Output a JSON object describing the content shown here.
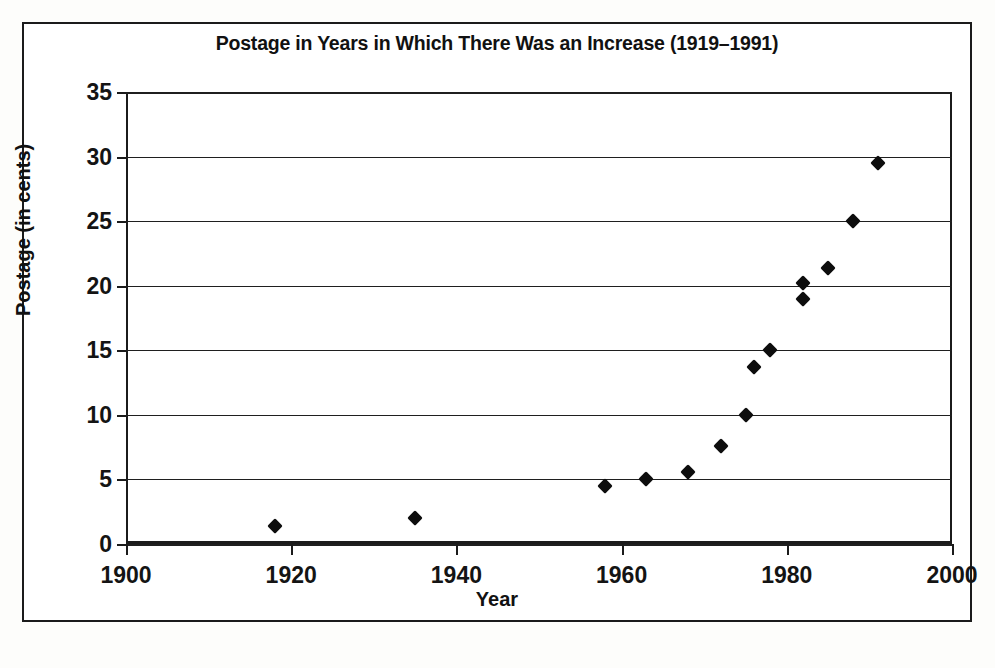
{
  "chart_data": {
    "type": "scatter",
    "title": "Postage in Years in Which There Was an Increase (1919–1991)",
    "xlabel": "Year",
    "ylabel": "Postage (in cents)",
    "xlim": [
      1900,
      2000
    ],
    "ylim": [
      0,
      35
    ],
    "xticks": [
      1900,
      1920,
      1940,
      1960,
      1980,
      2000
    ],
    "yticks": [
      0,
      5,
      10,
      15,
      20,
      25,
      30,
      35
    ],
    "grid": "horizontal",
    "legend": "none",
    "marker": "filled-diamond",
    "marker_color": "#0d0d0d",
    "points": [
      {
        "x": 1918,
        "y": 1.4
      },
      {
        "x": 1935,
        "y": 2.0
      },
      {
        "x": 1958,
        "y": 4.5
      },
      {
        "x": 1963,
        "y": 5.0
      },
      {
        "x": 1968,
        "y": 5.6
      },
      {
        "x": 1972,
        "y": 7.6
      },
      {
        "x": 1975,
        "y": 10.0
      },
      {
        "x": 1976,
        "y": 13.7
      },
      {
        "x": 1978,
        "y": 15.0
      },
      {
        "x": 1982,
        "y": 19.0
      },
      {
        "x": 1982,
        "y": 20.2
      },
      {
        "x": 1985,
        "y": 21.4
      },
      {
        "x": 1988,
        "y": 25.0
      },
      {
        "x": 1991,
        "y": 29.5
      }
    ]
  }
}
